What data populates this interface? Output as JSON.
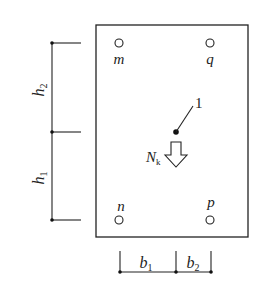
{
  "diagram": {
    "type": "pile-cap plan",
    "points": {
      "m": {
        "label": "m"
      },
      "q": {
        "label": "q"
      },
      "n": {
        "label": "n"
      },
      "p": {
        "label": "p"
      }
    },
    "load": {
      "label_main": "N",
      "label_sub": "k"
    },
    "centroid_marker": {
      "label": "1"
    },
    "dimensions": {
      "vertical": [
        {
          "label_main": "h",
          "label_sub": "2"
        },
        {
          "label_main": "h",
          "label_sub": "1"
        }
      ],
      "horizontal": [
        {
          "label_main": "b",
          "label_sub": "1"
        },
        {
          "label_main": "b",
          "label_sub": "2"
        }
      ]
    },
    "colors": {
      "line": "#222222",
      "background": "#ffffff"
    }
  }
}
